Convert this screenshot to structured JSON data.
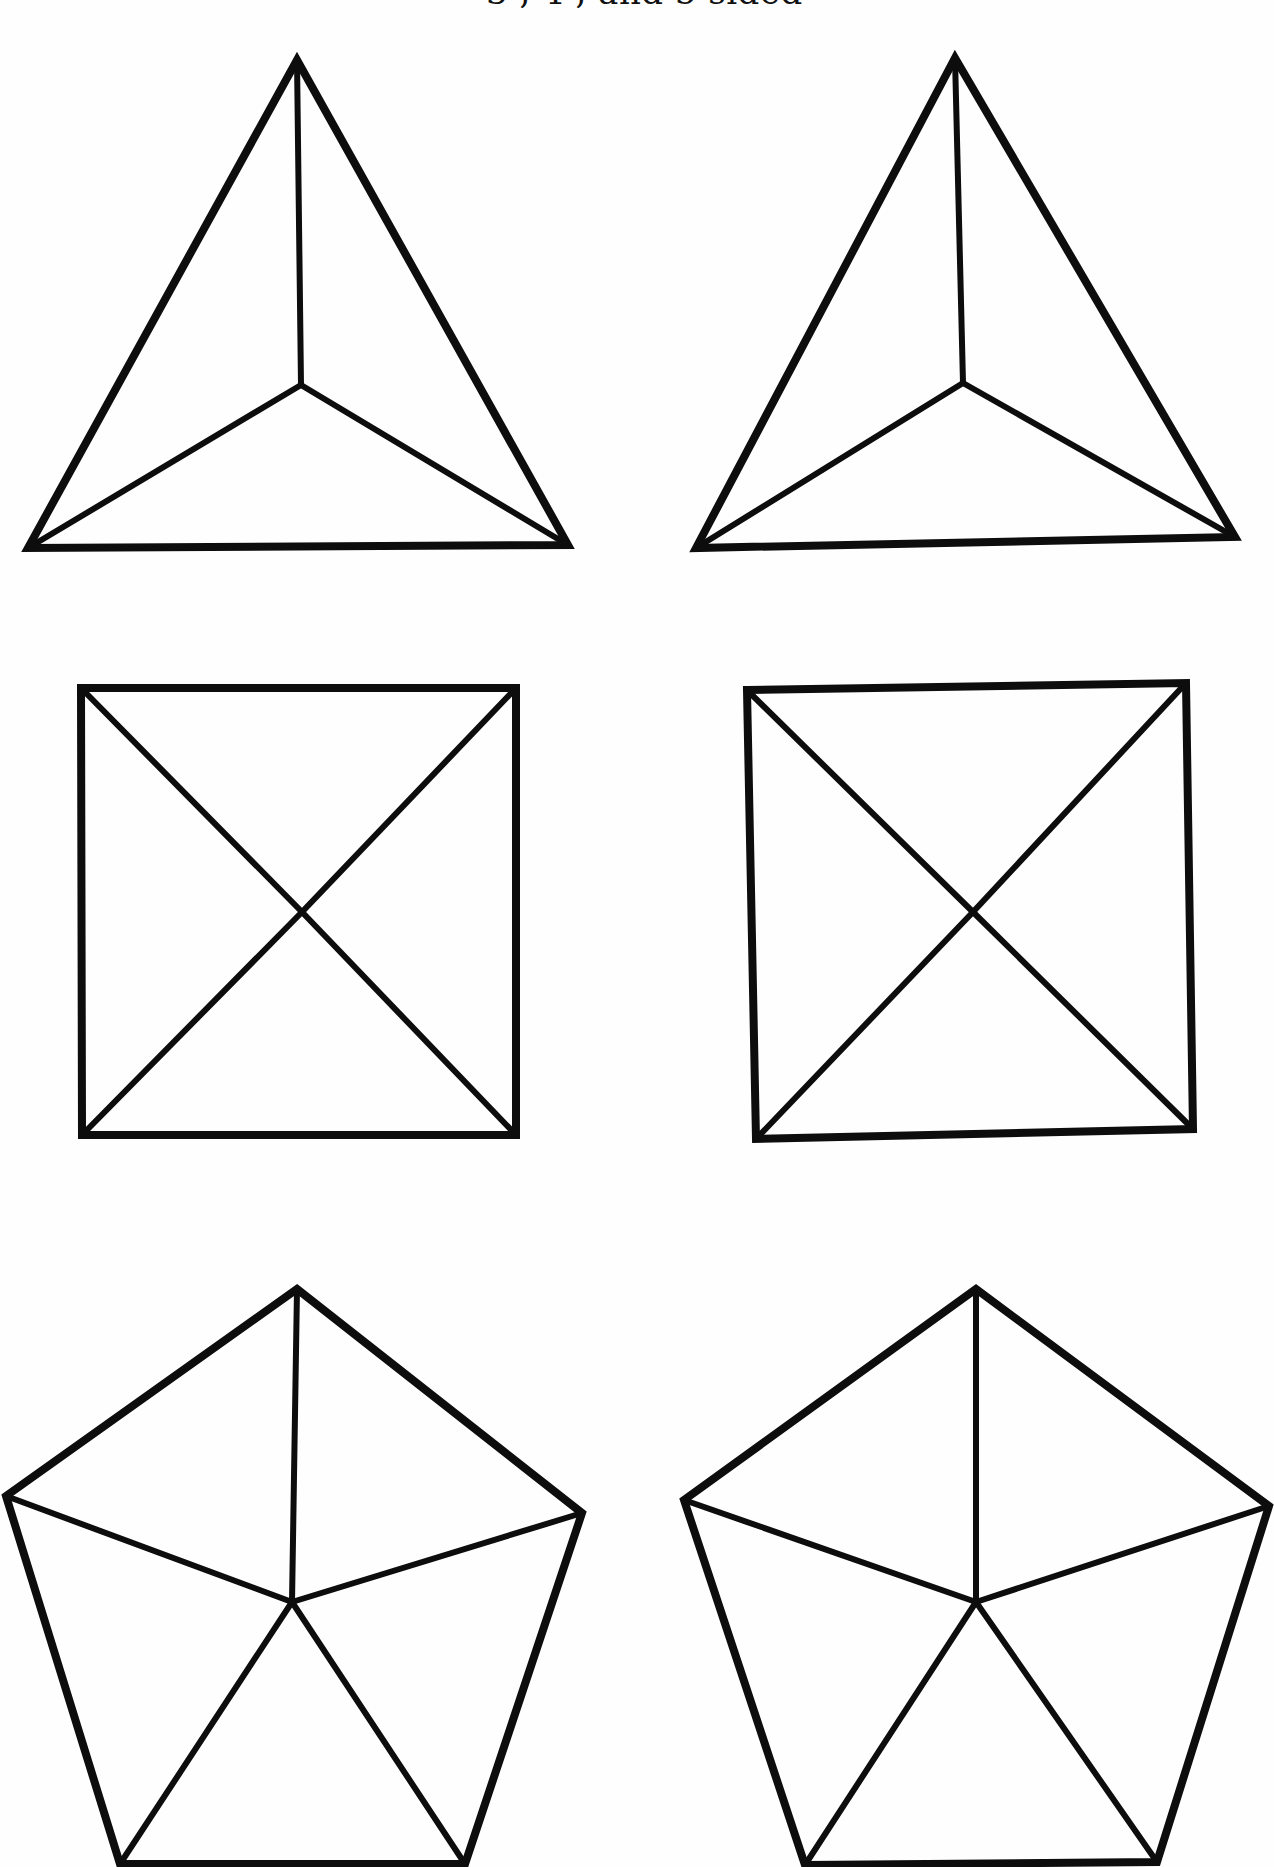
{
  "page": {
    "caption": "3 , 4 , and 5 sided",
    "background": "#ffffff",
    "ink_color": "#0d0d0d"
  },
  "figures": [
    {
      "id": "triangle-left",
      "sides": 3,
      "kind": "triangle with center lines",
      "outline": [
        [
          297,
          60
        ],
        [
          568,
          545
        ],
        [
          28,
          548
        ]
      ],
      "center": [
        301,
        385
      ]
    },
    {
      "id": "triangle-right",
      "sides": 3,
      "kind": "triangle with center lines",
      "outline": [
        [
          955,
          58
        ],
        [
          1235,
          537
        ],
        [
          696,
          548
        ]
      ],
      "center": [
        963,
        383
      ]
    },
    {
      "id": "square-left",
      "sides": 4,
      "kind": "square with diagonals",
      "outline": [
        [
          81,
          688
        ],
        [
          516,
          688
        ],
        [
          516,
          1135
        ],
        [
          82,
          1135
        ]
      ],
      "center": [
        302,
        912
      ]
    },
    {
      "id": "square-right",
      "sides": 4,
      "kind": "square with diagonals",
      "outline": [
        [
          747,
          690
        ],
        [
          1186,
          683
        ],
        [
          1193,
          1129
        ],
        [
          756,
          1139
        ]
      ],
      "center": [
        973,
        912
      ]
    },
    {
      "id": "pentagon-left",
      "sides": 5,
      "kind": "pentagon with center lines",
      "outline": [
        [
          297,
          1289
        ],
        [
          582,
          1513
        ],
        [
          465,
          1864
        ],
        [
          120,
          1864
        ],
        [
          6,
          1496
        ]
      ],
      "center": [
        292,
        1602
      ]
    },
    {
      "id": "pentagon-right",
      "sides": 5,
      "kind": "pentagon with center lines",
      "outline": [
        [
          976,
          1289
        ],
        [
          1269,
          1506
        ],
        [
          1157,
          1862
        ],
        [
          805,
          1865
        ],
        [
          684,
          1500
        ]
      ],
      "center": [
        976,
        1602
      ]
    }
  ]
}
